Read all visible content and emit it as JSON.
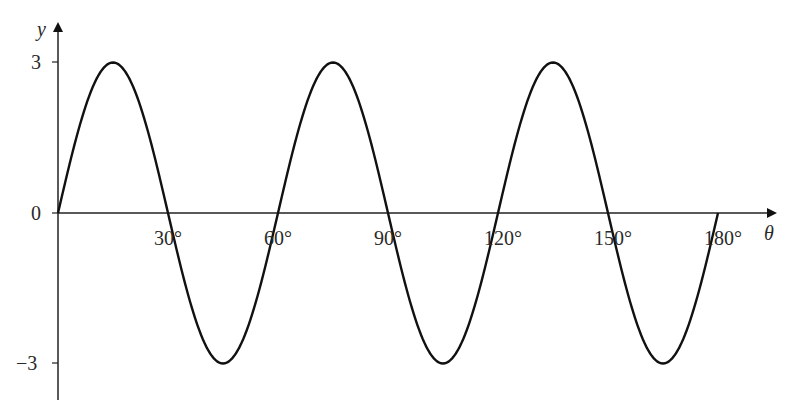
{
  "chart_data": {
    "type": "line",
    "title": "",
    "function": "y = 3 sin(6θ)",
    "xlabel": "θ",
    "ylabel": "y",
    "xlim": [
      0,
      180
    ],
    "ylim": [
      -3,
      3
    ],
    "x_ticks": [
      "30°",
      "60°",
      "90°",
      "120°",
      "150°",
      "180°"
    ],
    "y_ticks": [
      "3",
      "0",
      "−3"
    ],
    "grid": false,
    "legend": null,
    "series": [
      {
        "name": "y",
        "x": [
          0,
          15,
          30,
          45,
          60,
          75,
          90,
          105,
          120,
          135,
          150,
          165,
          180
        ],
        "values": [
          0,
          3,
          0,
          -3,
          0,
          3,
          0,
          -3,
          0,
          3,
          0,
          -3,
          0
        ]
      }
    ]
  },
  "axes": {
    "x_label": "θ",
    "y_label": "y",
    "origin_label": "0",
    "y_max_label": "3",
    "y_min_label": "−3"
  }
}
